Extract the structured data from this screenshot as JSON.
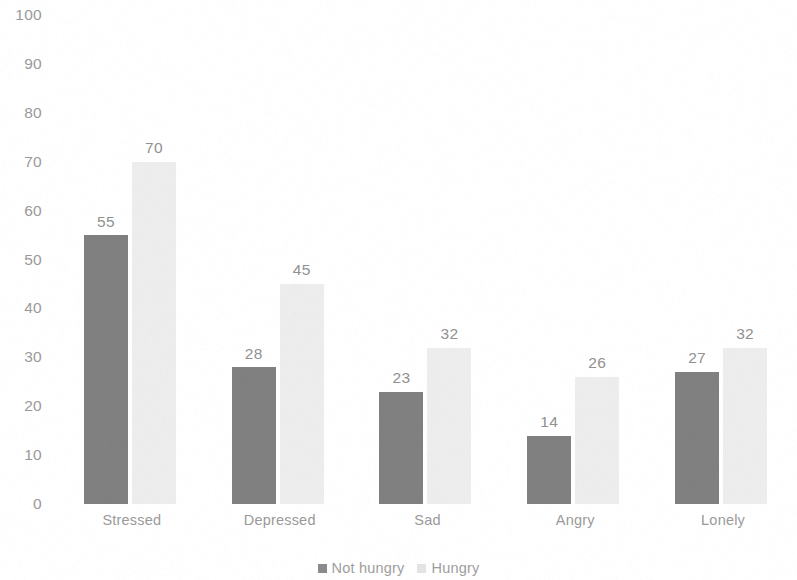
{
  "chart_data": {
    "type": "bar",
    "title": "",
    "subtitle": "",
    "xlabel": "",
    "ylabel": "",
    "categories": [
      "Stressed",
      "Depressed",
      "Sad",
      "Angry",
      "Lonely"
    ],
    "series": [
      {
        "name": "Not hungry",
        "color": "#808080",
        "values": [
          55,
          28,
          23,
          14,
          27
        ]
      },
      {
        "name": "Hungry",
        "color": "#ededed",
        "values": [
          70,
          45,
          32,
          26,
          32
        ]
      }
    ],
    "ylim": [
      0,
      100
    ],
    "ytick_step": 10,
    "yticks": [
      "100",
      "90",
      "80",
      "70",
      "60",
      "50",
      "40",
      "30",
      "20",
      "10",
      "0"
    ],
    "grid": false,
    "axis_line": false,
    "data_labels": true,
    "legend_position": "bottom-center",
    "legend_orientation": "horizontal",
    "bar_orientation": "vertical",
    "grouping": "clustered"
  },
  "axis": {
    "y_tick_labels": [
      "100",
      "90",
      "80",
      "70",
      "60",
      "50",
      "40",
      "30",
      "20",
      "10",
      "0"
    ]
  },
  "legend": {
    "items": [
      {
        "label": "Not hungry",
        "swatch": "legend-swatch-not-hungry"
      },
      {
        "label": "Hungry",
        "swatch": "legend-swatch-hungry"
      }
    ]
  },
  "colors": {
    "series_not_hungry": "#808080",
    "series_hungry": "#ededed",
    "text": "#9a9a9a",
    "background": "#ffffff"
  }
}
